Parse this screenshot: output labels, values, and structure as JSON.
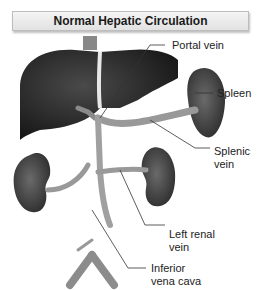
{
  "title": "Normal Hepatic Circulation",
  "labels": {
    "portal_vein": "Portal vein",
    "spleen": "Spleen",
    "splenic_vein_1": "Splenic",
    "splenic_vein_2": "vein",
    "left_renal_vein_1": "Left renal",
    "left_renal_vein_2": "vein",
    "ivc_1": "Inferior",
    "ivc_2": "vena cava"
  },
  "colors": {
    "organ_dark": "#2a2a2a",
    "vessel": "#9a9a9a",
    "leader_line": "#333333",
    "title_border": "#bdbdbd"
  }
}
